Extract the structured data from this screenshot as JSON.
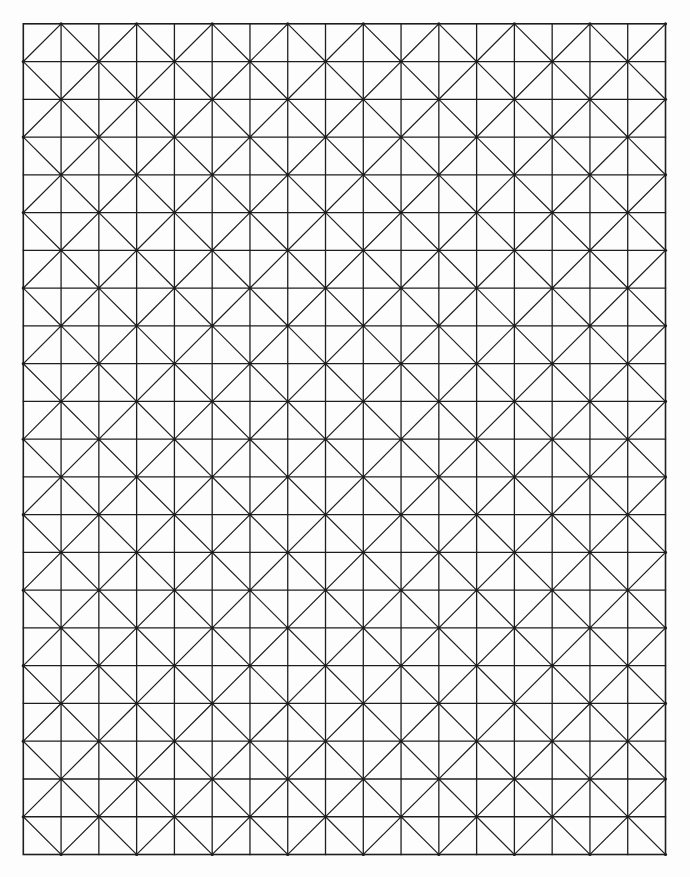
{
  "page": {
    "width": 690,
    "height": 877,
    "background": "#fdfdfd"
  },
  "grid": {
    "type": "square-grid-with-alternating-diagonals",
    "left": 23.3,
    "top": 23.8,
    "right": 665.5,
    "bottom": 854.5,
    "columns": 17,
    "rows": 22,
    "line_color": "#1e1e1e",
    "grid_line_width": 1.3,
    "diagonal_line_width": 1.2,
    "border_line_width": 1.6,
    "vertex_dot_radius": 1.6,
    "diagonal_parity": "odd"
  }
}
